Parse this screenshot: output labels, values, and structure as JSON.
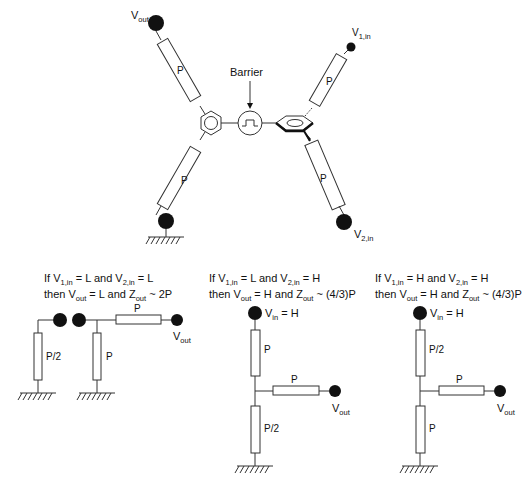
{
  "top_diagram": {
    "left_top_terminal": {
      "label": "V",
      "sub": "out"
    },
    "left_bottom_terminal": {
      "grounded": true
    },
    "right_top_terminal": {
      "label": "V",
      "sub": "1,in"
    },
    "right_bottom_terminal": {
      "label": "V",
      "sub": "2,in"
    },
    "resistor_label": "P",
    "barrier_label": "Barrier",
    "resistors": [
      "P",
      "P",
      "P",
      "P"
    ]
  },
  "circuits": [
    {
      "condition_line1": {
        "prefix": "If V",
        "sub1": "1,in",
        "mid": " = L and V",
        "sub2": "2,in",
        "suffix": " = L"
      },
      "condition_line2": {
        "prefix": "then V",
        "sub1": "out",
        "mid": " = L and Z",
        "sub2": "out",
        "suffix": " ~ 2P"
      },
      "resistors": [
        "P/2",
        "P",
        "P"
      ],
      "output": {
        "label": "V",
        "sub": "out"
      }
    },
    {
      "condition_line1": {
        "prefix": "If V",
        "sub1": "1,in",
        "mid": " = L and V",
        "sub2": "2,in",
        "suffix": " = H"
      },
      "condition_line2": {
        "prefix": "then V",
        "sub1": "out",
        "mid": " = H and Z",
        "sub2": "out",
        "suffix": " ~ (4/3)P"
      },
      "input": {
        "label": "V",
        "sub": "in",
        "suffix": " = H"
      },
      "resistors": [
        "P",
        "P",
        "P/2"
      ],
      "output": {
        "label": "V",
        "sub": "out"
      }
    },
    {
      "condition_line1": {
        "prefix": "If V",
        "sub1": "1,in",
        "mid": " = H and V",
        "sub2": "2,in",
        "suffix": " = H"
      },
      "condition_line2": {
        "prefix": "then V",
        "sub1": "out",
        "mid": " = H and Z",
        "sub2": "out",
        "suffix": " ~ (4/3)P"
      },
      "input": {
        "label": "V",
        "sub": "in",
        "suffix": " = H"
      },
      "resistors": [
        "P/2",
        "P",
        "P"
      ],
      "output": {
        "label": "V",
        "sub": "out"
      }
    }
  ]
}
